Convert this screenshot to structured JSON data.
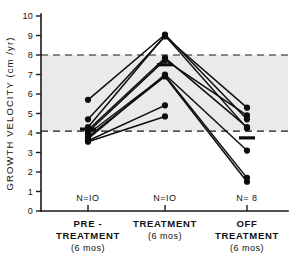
{
  "figure": {
    "title": "",
    "background_color": "#ffffff",
    "ink_color": "#0d0d0d",
    "band_color": "#d8d8d8"
  },
  "axis": {
    "y_title": "GROWTH  VELOCITY  (cm /yr)",
    "y_ticks": [
      "0",
      "1",
      "2",
      "3",
      "4",
      "5",
      "6",
      "7",
      "8",
      "9",
      "10"
    ],
    "y_min": 0,
    "y_max": 10,
    "x_categories": [
      {
        "line1": "PRE -",
        "line2": "TREATMENT",
        "line3": "(6 mos)",
        "n": "N=IO"
      },
      {
        "line1": "TREATMENT",
        "line2": "",
        "line3": "(6 mos)",
        "n": "N=IO"
      },
      {
        "line1": "OFF",
        "line2": "TREATMENT",
        "line3": "(6 mos)",
        "n": "N= 8"
      }
    ]
  },
  "chart_data": {
    "type": "line",
    "title": "",
    "xlabel": "",
    "ylabel": "GROWTH VELOCITY (cm/yr)",
    "ylim": [
      0,
      10
    ],
    "grid": false,
    "legend": "none",
    "categories": [
      "PRE-TREATMENT (6 mos)",
      "TREATMENT (6 mos)",
      "OFF TREATMENT (6 mos)"
    ],
    "n_per_category": [
      10,
      10,
      8
    ],
    "reference_band": {
      "low": 4.1,
      "high": 8.0,
      "style": "dashed-shaded"
    },
    "means": [
      {
        "category": "PRE-TREATMENT (6 mos)",
        "value": 4.2
      },
      {
        "category": "TREATMENT (6 mos)",
        "value": 7.5
      },
      {
        "category": "OFF TREATMENT (6 mos)",
        "value": 3.75
      }
    ],
    "series": [
      {
        "name": "subject-1",
        "values": [
          5.7,
          9.05,
          4.7
        ]
      },
      {
        "name": "subject-2",
        "values": [
          4.7,
          8.95,
          5.3
        ]
      },
      {
        "name": "subject-3",
        "values": [
          4.3,
          9.0,
          4.25
        ]
      },
      {
        "name": "subject-4",
        "values": [
          4.15,
          7.85,
          4.3
        ]
      },
      {
        "name": "subject-5",
        "values": [
          4.05,
          7.75,
          4.9
        ]
      },
      {
        "name": "subject-6",
        "values": [
          3.95,
          6.95,
          1.7
        ]
      },
      {
        "name": "subject-7",
        "values": [
          3.8,
          6.9,
          1.5
        ]
      },
      {
        "name": "subject-8",
        "values": [
          3.7,
          7.0,
          3.1
        ]
      },
      {
        "name": "subject-9",
        "values": [
          3.6,
          5.42,
          null
        ]
      },
      {
        "name": "subject-10",
        "values": [
          3.55,
          4.85,
          null
        ]
      }
    ]
  }
}
